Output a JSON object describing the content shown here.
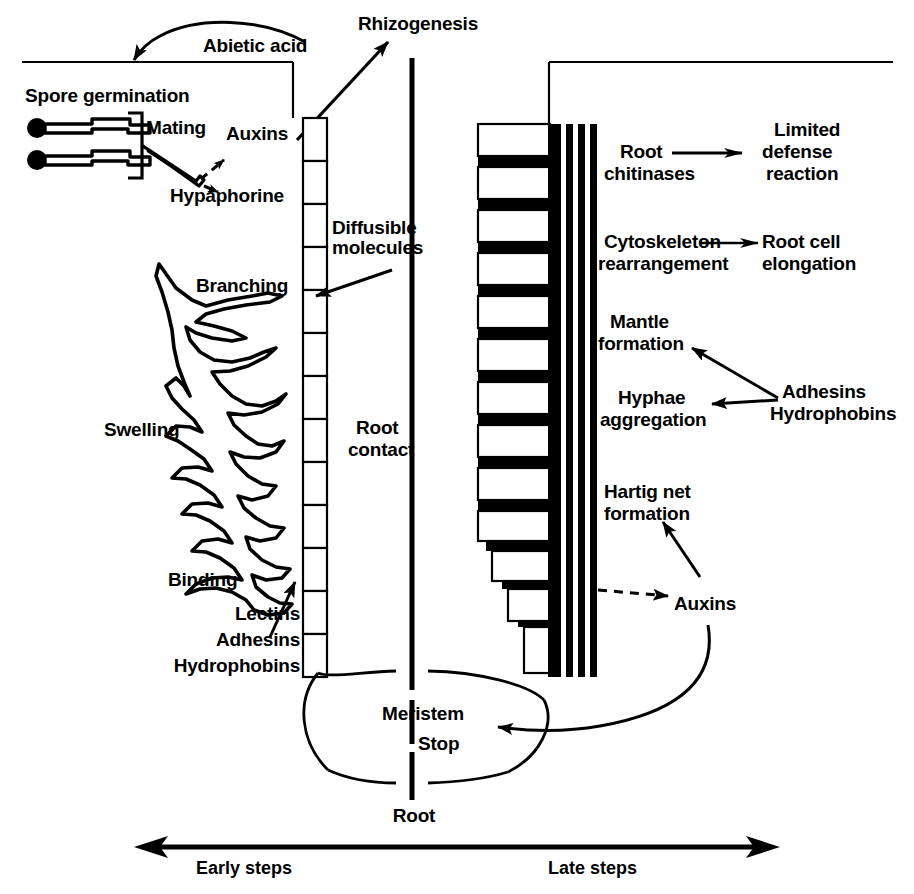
{
  "figure": {
    "background": "#ffffff",
    "ink": "#000000",
    "width": 914,
    "height": 894
  },
  "labels": {
    "abietic_acid": "Abietic acid",
    "rhizogenesis": "Rhizogenesis",
    "spore_germination": "Spore germination",
    "mating": "Mating",
    "auxins_top": "Auxins",
    "hypaphorine": "Hypaphorine",
    "diffusible_molecules_line1": "Diffusible",
    "diffusible_molecules_line2": "molecules",
    "branching": "Branching",
    "swelling": "Swelling",
    "binding": "Binding",
    "lectins": "Lectins",
    "adhesins_left": "Adhesins",
    "hydrophobins_left": "Hydrophobins",
    "root_contact_line1": "Root",
    "root_contact_line2": "contact",
    "root_chitinases_line1": "Root",
    "root_chitinases_line2": "chitinases",
    "limited_defense_line1": "Limited",
    "limited_defense_line2": "defense",
    "limited_defense_line3": "reaction",
    "cytoskeleton_line1": "Cytoskeleton",
    "cytoskeleton_line2": "rearrangement",
    "root_cell_elongation_line1": "Root cell",
    "root_cell_elongation_line2": "elongation",
    "mantle_formation_line1": "Mantle",
    "mantle_formation_line2": "formation",
    "hyphae_aggregation_line1": "Hyphae",
    "hyphae_aggregation_line2": "aggregation",
    "adhesins_right": "Adhesins",
    "hydrophobins_right": "Hydrophobins",
    "hartig_net_line1": "Hartig net",
    "hartig_net_line2": "formation",
    "auxins_bottom": "Auxins",
    "meristem": "Meristem",
    "stop": "Stop",
    "root_axis": "Root",
    "early_steps": "Early steps",
    "late_steps": "Late steps"
  },
  "icons": {
    "spore_1": "germinating-spore-icon",
    "spore_2": "germinating-spore-icon",
    "mating_hypha": "mating-hypha-icon",
    "bracket": "spore-bracket-icon",
    "hyphal_network": "branching-hyphal-network-icon",
    "root_cell_column_left": "root-epidermis-cell-column-icon",
    "root_cell_column_right": "colonized-root-cell-column-icon",
    "fungal_mantle": "fungal-mantle-icon",
    "hartig_net_bars": "hartig-net-bars-icon",
    "root_tip_cone": "root-tip-cone-icon",
    "soil_surface_line": "soil-surface-line-icon"
  },
  "arrows": {
    "abietic_to_spores": "curved-arrow-abietic-acid-to-spore-germination",
    "auxins_to_root": "arrow-auxins-to-rhizogenesis",
    "mating_to_auxins": "dashed-arrow-mating-to-auxins",
    "mating_to_hypaphorine": "dashed-arrow-mating-to-hypaphorine",
    "diffusible_to_hyphae": "arrow-diffusible-molecules-to-branching",
    "lectins_to_binding": "arrow-lectins-adhesins-hydrophobins-to-binding",
    "chitinases_to_defense": "arrow-root-chitinases-to-limited-defense-reaction",
    "cytoskeleton_to_elongation": "arrow-cytoskeleton-rearrangement-to-root-cell-elongation",
    "adhesins_to_mantle": "arrow-adhesins-hydrophobins-to-mantle-formation",
    "adhesins_to_aggregation": "arrow-adhesins-hydrophobins-to-hyphae-aggregation",
    "auxins_to_hartig": "arrow-auxins-to-hartig-net-formation",
    "auxins_dashed_to_root": "dashed-arrow-auxins-to-root",
    "auxins_curve_to_meristem": "curved-arrow-auxins-to-meristem-stop",
    "timeline": "double-headed-timeline-arrow"
  },
  "structure": {
    "left_cell_count": 13,
    "right_cell_count": 13,
    "mantle_bar_count": 4
  }
}
